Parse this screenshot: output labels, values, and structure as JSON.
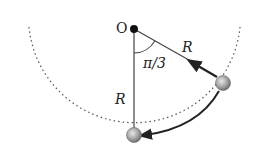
{
  "diagram": {
    "type": "pendulum-arc",
    "labels": {
      "pivot": "O",
      "radius_slanted": "R",
      "radius_vertical": "R",
      "angle": "π/3"
    },
    "geometry": {
      "pivot": {
        "x": 134,
        "y": 29
      },
      "radius_px": 106,
      "angle_rad": "π/3",
      "ball_start": {
        "x": 223,
        "y": 83
      },
      "ball_end": {
        "x": 134,
        "y": 135
      }
    },
    "colors": {
      "line": "#444444",
      "dotted_path": "#555555",
      "ball_fill": "#9a9a9a",
      "pivot_fill": "#111111",
      "background": "#ffffff"
    }
  }
}
